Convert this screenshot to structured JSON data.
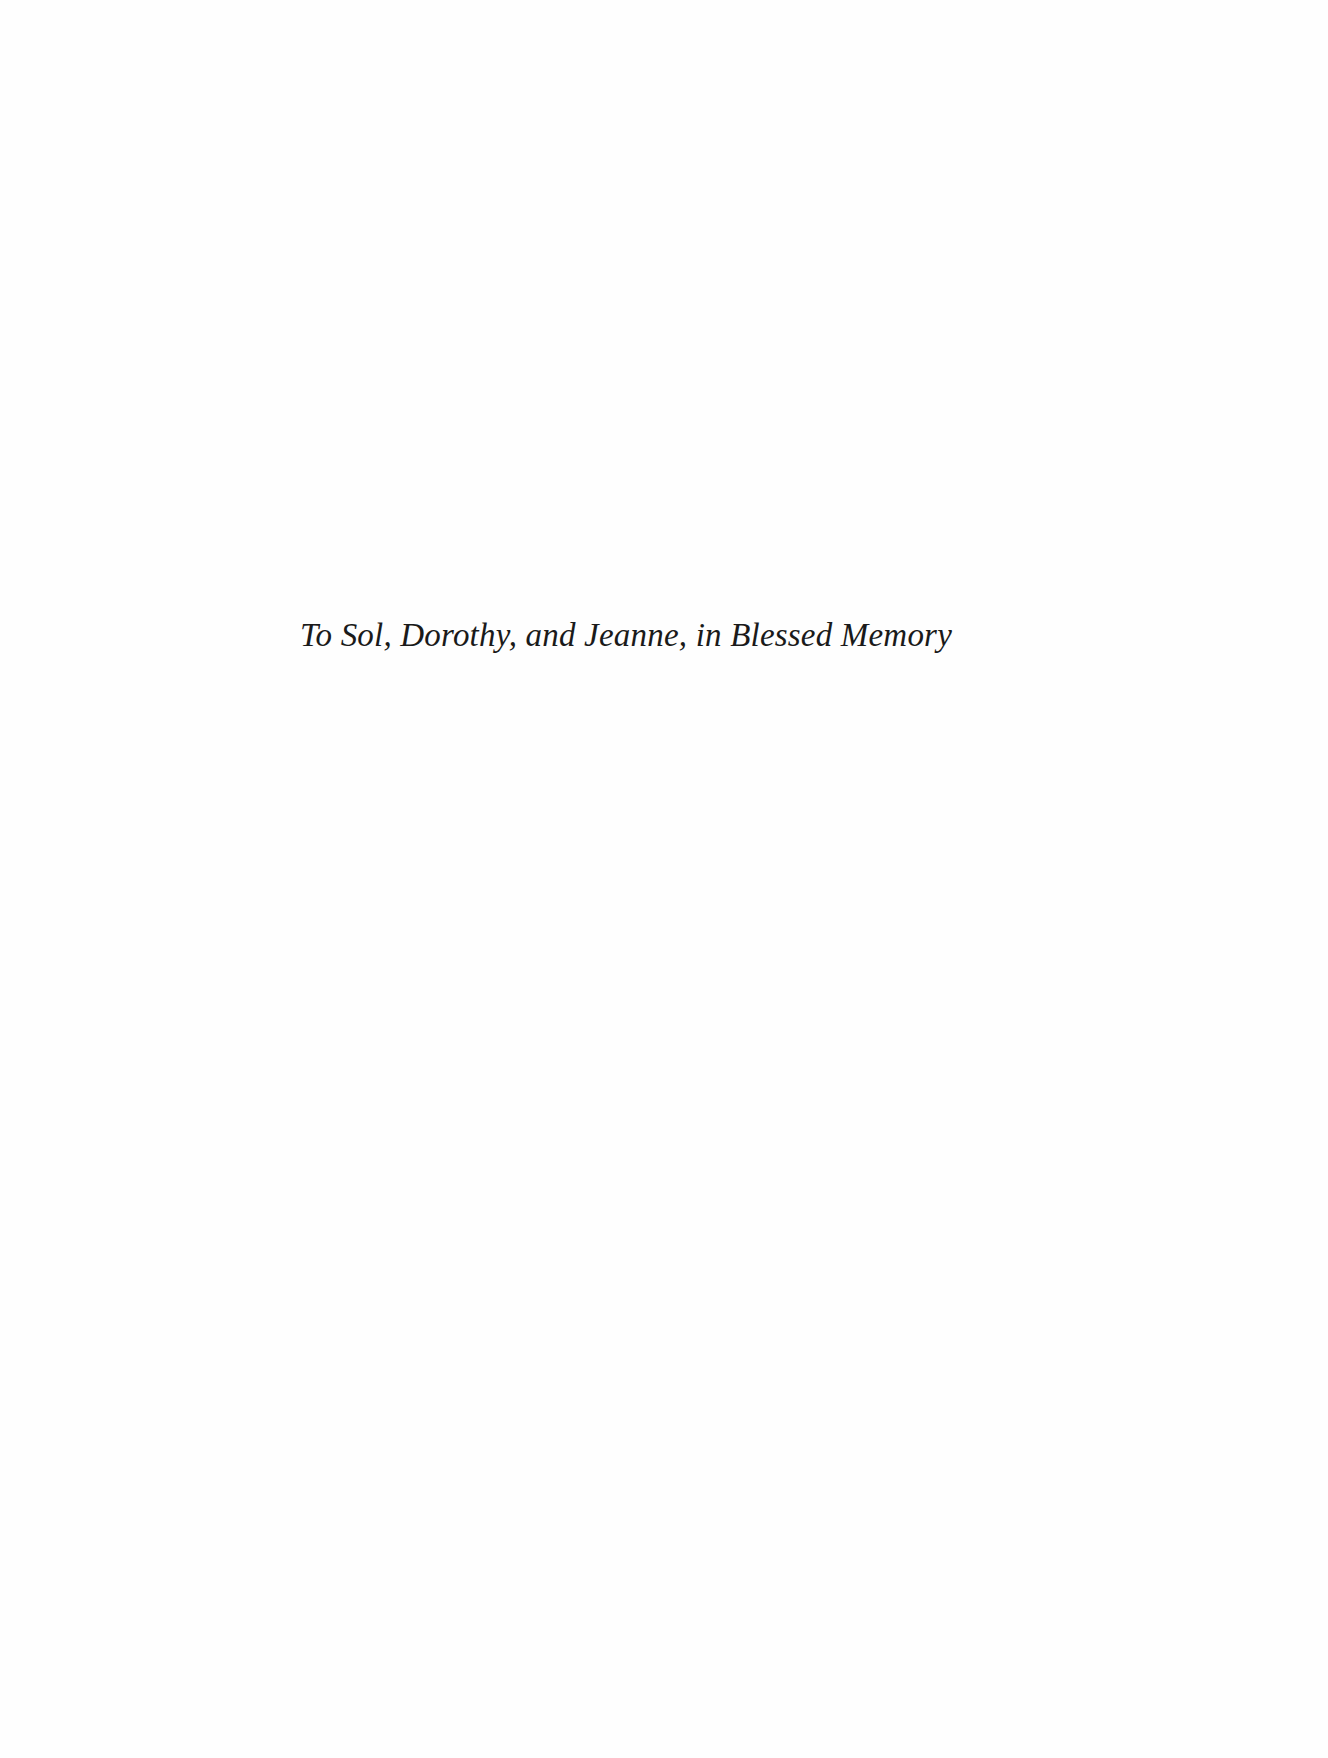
{
  "page": {
    "type": "dedication",
    "dedication_text": "To Sol, Dorothy, and Jeanne, in Blessed Memory",
    "colors": {
      "background": "#fefefe",
      "text": "#1a1a1a"
    }
  }
}
